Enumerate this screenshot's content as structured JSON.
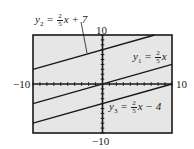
{
  "chart_data": {
    "type": "line",
    "title": "",
    "xlabel": "",
    "ylabel": "",
    "xlim": [
      -10,
      10
    ],
    "ylim": [
      -10,
      10
    ],
    "grid": false,
    "tick_marks": true,
    "tick_step": 1,
    "axis_labels": {
      "x_min": "−10",
      "x_max": "10",
      "y_min": "−10",
      "y_max": "10"
    },
    "series": [
      {
        "name": "y1",
        "label": "y1 = (2/5)x",
        "slope": 0.4,
        "intercept": 0,
        "points": [
          [
            -10,
            -4
          ],
          [
            10,
            4
          ]
        ]
      },
      {
        "name": "y2",
        "label": "y2 = (2/5)x + 7",
        "slope": 0.4,
        "intercept": 7,
        "points": [
          [
            -10,
            3
          ],
          [
            7.5,
            10
          ]
        ]
      },
      {
        "name": "y3",
        "label": "y3 = (2/5)x − 4",
        "slope": 0.4,
        "intercept": -4,
        "points": [
          [
            -10,
            -8
          ],
          [
            10,
            0
          ]
        ]
      }
    ],
    "colors": {
      "background": "#e6e6e6",
      "line": "#1a1a1a",
      "frame": "#1a1a1a"
    }
  },
  "labels": {
    "y1": {
      "var": "y",
      "sub": "1",
      "eq": " = ",
      "num": "2",
      "den": "5",
      "rest": "x"
    },
    "y2": {
      "var": "y",
      "sub": "2",
      "eq": " = ",
      "num": "2",
      "den": "5",
      "rest": "x + 7"
    },
    "y3": {
      "var": "y",
      "sub": "3",
      "eq": " = ",
      "num": "2",
      "den": "5",
      "rest": "x − 4"
    },
    "x_min": "−10",
    "x_max": "10",
    "y_min": "−10",
    "y_max": "10"
  }
}
